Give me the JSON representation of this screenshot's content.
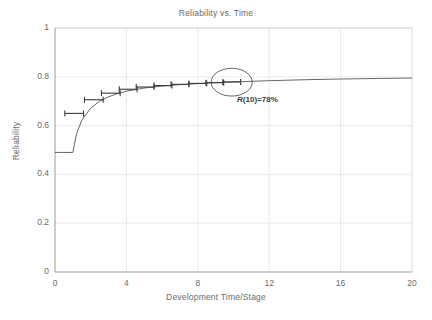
{
  "chart_data": {
    "type": "line",
    "title": "Reliability vs. Time",
    "xlabel": "Development Time/Stage",
    "ylabel": "Reliability",
    "xlim": [
      0,
      20
    ],
    "ylim": [
      0,
      1
    ],
    "xticks": [
      0,
      4,
      8,
      12,
      16,
      20
    ],
    "xtick_labels": [
      "0",
      "4",
      "8",
      "12",
      "16",
      "20"
    ],
    "yticks": [
      0,
      0.2,
      0.4,
      0.6,
      0.8,
      1
    ],
    "ytick_labels": [
      "0",
      "0.2",
      "0.4",
      "0.6",
      "0.8",
      "1"
    ],
    "grid": true,
    "grid_color": "#dcdcdc",
    "legend": null,
    "line_color": "#555555",
    "series": [
      {
        "name": "Reliability growth curve",
        "description": "Flat at 0.49 through stage 1, then rises asymptotically toward 0.795",
        "x": [
          0,
          0.5,
          1,
          1.2,
          1.5,
          2,
          2.5,
          3,
          3.5,
          4,
          5,
          6,
          7,
          8,
          9,
          10,
          12,
          14,
          16,
          18,
          20
        ],
        "y": [
          0.49,
          0.49,
          0.49,
          0.565,
          0.622,
          0.672,
          0.7,
          0.718,
          0.731,
          0.741,
          0.754,
          0.762,
          0.768,
          0.772,
          0.776,
          0.779,
          0.784,
          0.788,
          0.791,
          0.793,
          0.795
        ]
      }
    ],
    "error_bars": {
      "orientation": "horizontal",
      "capped": true,
      "color": "#3a3a3a",
      "points": [
        {
          "stage": 1,
          "y": 0.65,
          "x_low": 0.55,
          "x_high": 1.6
        },
        {
          "stage": 2,
          "y": 0.706,
          "x_low": 1.65,
          "x_high": 2.7
        },
        {
          "stage": 3,
          "y": 0.733,
          "x_low": 2.6,
          "x_high": 3.65
        },
        {
          "stage": 4,
          "y": 0.749,
          "x_low": 3.6,
          "x_high": 4.6
        },
        {
          "stage": 5,
          "y": 0.758,
          "x_low": 4.55,
          "x_high": 5.55
        },
        {
          "stage": 6,
          "y": 0.764,
          "x_low": 5.55,
          "x_high": 6.55
        },
        {
          "stage": 7,
          "y": 0.769,
          "x_low": 6.5,
          "x_high": 7.5
        },
        {
          "stage": 8,
          "y": 0.773,
          "x_low": 7.5,
          "x_high": 8.5
        },
        {
          "stage": 9,
          "y": 0.776,
          "x_low": 8.45,
          "x_high": 9.45
        },
        {
          "stage": 10,
          "y": 0.779,
          "x_low": 9.4,
          "x_high": 10.4
        }
      ]
    },
    "annotations": [
      {
        "name": "highlight-ellipse",
        "shape": "ellipse",
        "cx": 9.9,
        "cy": 0.778,
        "rx": 1.15,
        "ry": 0.057,
        "stroke": "#555555"
      },
      {
        "name": "reliability-callout",
        "text_prefix": "R",
        "text_rest": "(10)=78%",
        "x": 10.2,
        "y": 0.7
      }
    ]
  }
}
